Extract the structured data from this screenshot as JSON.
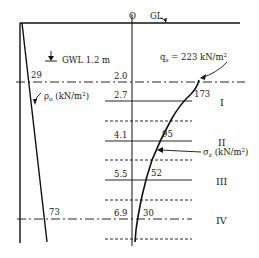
{
  "diagram": {
    "top_labels": {
      "origin": "O",
      "ground_level": "GL"
    },
    "gwl_label": "GWL 1.2 m",
    "qs_label": "q",
    "qs_sub": "s",
    "qs_value": " = 223 kN/m",
    "qs_sup": "2",
    "rho_label": "ρ",
    "rho_sub": "o",
    "rho_unit": " (kN/m",
    "rho_sup": "2",
    "rho_close": ")",
    "sigma_label": "σ",
    "sigma_sub": "z",
    "sigma_unit": " (kN/m",
    "sigma_sup": "2",
    "sigma_close": ")",
    "depths": [
      "2.0",
      "2.7",
      "4.1",
      "5.5",
      "6.9"
    ],
    "sigma_values": [
      "173",
      "95",
      "52",
      "30"
    ],
    "rho_values": [
      "29",
      "73"
    ],
    "layers": [
      "I",
      "II",
      "III",
      "IV"
    ]
  }
}
